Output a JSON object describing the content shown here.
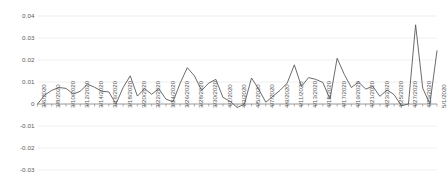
{
  "chart_data": {
    "type": "line",
    "title": "",
    "xlabel": "",
    "ylabel": "",
    "ylim": [
      -0.03,
      0.04
    ],
    "ytick_values": [
      0.04,
      0.03,
      0.02,
      0.01,
      0,
      -0.01,
      -0.02,
      -0.03
    ],
    "ytick_labels": [
      "0.04",
      "0.03",
      "0.02",
      "0.01",
      "0",
      "-0.01",
      "-0.02",
      "-0.03"
    ],
    "grid": true,
    "legend": "none",
    "series_color": "#5a5a5a",
    "gridline_color": "#e8e8e8",
    "axis_color": "#8c8c8c",
    "x": [
      "3/6/2020",
      "3/7/2020",
      "3/8/2020",
      "3/9/2020",
      "3/10/2020",
      "3/11/2020",
      "3/12/2020",
      "3/13/2020",
      "3/14/2020",
      "3/15/2020",
      "3/16/2020",
      "3/17/2020",
      "3/18/2020",
      "3/19/2020",
      "3/20/2020",
      "3/21/2020",
      "3/22/2020",
      "3/23/2020",
      "3/24/2020",
      "3/25/2020",
      "3/26/2020",
      "3/27/2020",
      "3/28/2020",
      "3/29/2020",
      "3/30/2020",
      "3/31/2020",
      "4/1/2020",
      "4/2/2020",
      "4/3/2020",
      "4/4/2020",
      "4/5/2020",
      "4/6/2020",
      "4/7/2020",
      "4/8/2020",
      "4/9/2020",
      "4/10/2020",
      "4/11/2020",
      "4/12/2020",
      "4/13/2020",
      "4/14/2020",
      "4/15/2020",
      "4/16/2020",
      "4/17/2020",
      "4/18/2020",
      "4/19/2020",
      "4/20/2020",
      "4/21/2020",
      "4/22/2020",
      "4/23/2020",
      "4/24/2020",
      "4/25/2020",
      "4/26/2020",
      "4/27/2020",
      "4/28/2020",
      "4/29/2020",
      "4/30/2020",
      "5/1/2020"
    ],
    "xtick_labels": [
      "3/6/2020",
      "3/8/2020",
      "3/10/2020",
      "3/12/2020",
      "3/14/2020",
      "3/16/2020",
      "3/18/2020",
      "3/20/2020",
      "3/22/2020",
      "3/24/2020",
      "3/26/2020",
      "3/28/2020",
      "3/30/2020",
      "4/1/2020",
      "4/3/2020",
      "4/5/2020",
      "4/7/2020",
      "4/9/2020",
      "4/11/2020",
      "4/13/2020",
      "4/15/2020",
      "4/17/2020",
      "4/19/2020",
      "4/21/2020",
      "4/23/2020",
      "4/25/2020",
      "4/27/2020",
      "4/29/2020",
      "5/1/2020"
    ],
    "values": [
      0.0,
      0.004,
      0.0062,
      0.0075,
      0.0071,
      0.0045,
      0.0058,
      0.009,
      0.0076,
      0.0058,
      0.0055,
      0.0,
      0.0075,
      0.0128,
      0.0036,
      0.007,
      0.0044,
      0.007,
      0.0022,
      0.001,
      0.0095,
      0.0165,
      0.0128,
      0.0062,
      0.0095,
      0.0112,
      0.003,
      0.0012,
      -0.0016,
      0.0,
      0.0118,
      0.0068,
      0.0008,
      0.0035,
      0.0062,
      0.0095,
      0.0178,
      0.008,
      0.012,
      0.0112,
      0.0098,
      0.0022,
      0.0208,
      0.0135,
      0.0075,
      0.01,
      0.0068,
      0.008,
      0.0035,
      0.0064,
      0.0042,
      -0.0008,
      0.0,
      0.036,
      0.0072,
      0.0,
      0.0242
    ]
  }
}
